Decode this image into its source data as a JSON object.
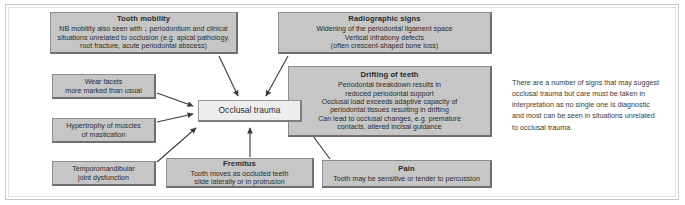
{
  "diagram": {
    "central": {
      "label": "Occlusal trauma"
    },
    "nodes": {
      "tooth_mobility": {
        "title": "Tooth mobility",
        "lines": [
          "NB mobility also seen with ↓ periodontium and clinical",
          "situations unrelated to occlusion (e.g. apical pathology,",
          "root fracture, acute periodontal abscess)"
        ]
      },
      "radiographic_signs": {
        "title": "Radiographic signs",
        "lines": [
          "Widening of the periodontal ligament space",
          "Vertical infrabony defects",
          "(often crescent-shaped bone loss)"
        ]
      },
      "wear_facets": {
        "title": "",
        "lines": [
          "Wear facets",
          "more marked than usual"
        ]
      },
      "hypertrophy": {
        "title": "",
        "lines": [
          "Hypertrophy of muscles",
          "of mastication"
        ]
      },
      "tmj_dysfunction": {
        "title": "",
        "lines": [
          "Temporomandibular",
          "joint dysfunction"
        ]
      },
      "drifting_of_teeth": {
        "title": "Drifting of teeth",
        "lines": [
          "Periodontal breakdown results in",
          "reduced periodontal support",
          "Occlusal load exceeds adaptive capacity of",
          "periodontal tissues resulting in drifting",
          "Can lead to occlusal changes, e.g. premature",
          "contacts, altered incisal guidance"
        ]
      },
      "fremitus": {
        "title": "Fremitus",
        "lines": [
          "Tooth moves as occluded  teeth",
          "slide laterally or in protrusion"
        ]
      },
      "pain": {
        "title": "Pain",
        "lines": [
          "Tooth may be sensitive or tender to percussion"
        ]
      }
    },
    "sidenote": {
      "lines": [
        "There are a number of signs that may suggest",
        "occlusal trauma but care must be taken in",
        "interpretation as no single one is diagnostic",
        "and most can be seen in situations unrelated",
        "to occlusal trauma."
      ]
    },
    "colors": {
      "node_fill": "#c6c6c6",
      "node_border": "#8d8d8d",
      "central_fill": "#ededed",
      "connector": "#3a3a3a",
      "text": "#2b2b2b",
      "frame": "#c9c9c9",
      "background": "#ffffff"
    }
  }
}
